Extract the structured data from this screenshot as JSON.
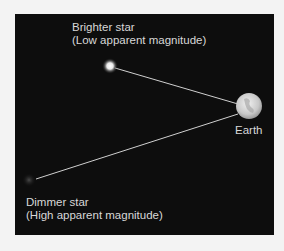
{
  "diagram": {
    "bright_star": {
      "title": "Brighter star",
      "subtitle": "(Low apparent magnitude)"
    },
    "dim_star": {
      "title": "Dimmer star",
      "subtitle": "(High apparent magnitude)"
    },
    "earth": {
      "label": "Earth"
    },
    "colors": {
      "background": "#f3f3f3",
      "panel": "#0d0d0d",
      "text": "#d8d8d8",
      "line": "#d0d0d0"
    }
  }
}
